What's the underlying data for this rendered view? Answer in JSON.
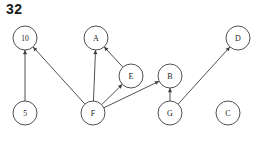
{
  "title": "32",
  "colors": {
    "stroke": "#3d3d3d",
    "node_fill": "#ffffff",
    "label": "#1a1a1a",
    "background": "#ffffff",
    "title": "#1a1a1a"
  },
  "graph": {
    "type": "directed-graph",
    "node_radius": 12,
    "nodes": [
      {
        "id": "10",
        "label": "10",
        "x": 25,
        "y": 38,
        "kind": "numeric"
      },
      {
        "id": "A",
        "label": "A",
        "x": 96,
        "y": 38,
        "kind": "letter"
      },
      {
        "id": "D",
        "label": "D",
        "x": 238,
        "y": 38,
        "kind": "letter"
      },
      {
        "id": "E",
        "label": "E",
        "x": 131,
        "y": 76,
        "kind": "letter"
      },
      {
        "id": "B",
        "label": "B",
        "x": 170,
        "y": 76,
        "kind": "letter"
      },
      {
        "id": "5",
        "label": "5",
        "x": 25,
        "y": 113,
        "kind": "numeric"
      },
      {
        "id": "F",
        "label": "F",
        "x": 93,
        "y": 113,
        "kind": "letter"
      },
      {
        "id": "G",
        "label": "G",
        "x": 170,
        "y": 113,
        "kind": "letter"
      },
      {
        "id": "C",
        "label": "C",
        "x": 228,
        "y": 113,
        "kind": "letter"
      }
    ],
    "edges": [
      {
        "from": "5",
        "to": "10",
        "directed": true
      },
      {
        "from": "F",
        "to": "10",
        "directed": true
      },
      {
        "from": "F",
        "to": "A",
        "directed": true
      },
      {
        "from": "E",
        "to": "A",
        "directed": true
      },
      {
        "from": "F",
        "to": "E",
        "directed": true
      },
      {
        "from": "F",
        "to": "B",
        "directed": true
      },
      {
        "from": "G",
        "to": "B",
        "directed": true
      },
      {
        "from": "G",
        "to": "D",
        "directed": true
      }
    ],
    "isolated_nodes": [
      "C"
    ]
  }
}
